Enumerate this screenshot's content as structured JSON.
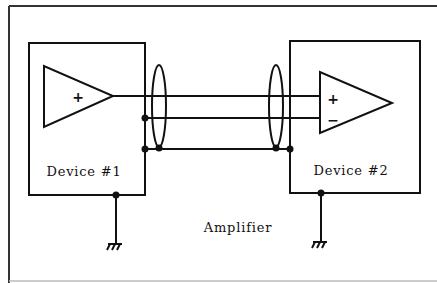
{
  "diagram": {
    "title": "Amplifier",
    "devices": [
      {
        "label": "Device #1"
      },
      {
        "label": "Device #2"
      }
    ],
    "amplifiers": [
      {
        "inputs": [
          "+"
        ]
      },
      {
        "inputs": [
          "+",
          "−"
        ]
      }
    ],
    "colors": {
      "line": "#111111",
      "frame": "#222222",
      "background": "#ffffff"
    }
  }
}
